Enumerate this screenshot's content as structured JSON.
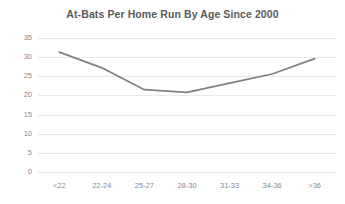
{
  "chart_data": {
    "type": "line",
    "title": "At-Bats Per Home Run By Age Since 2000",
    "xlabel": "",
    "ylabel": "",
    "categories": [
      "<22",
      "22-24",
      "25-27",
      "28-30",
      "31-33",
      "34-36",
      ">36"
    ],
    "values": [
      31.3,
      27.2,
      21.5,
      20.8,
      23.2,
      25.6,
      29.6
    ],
    "series": [
      {
        "name": "At-Bats Per Home Run",
        "values": [
          31.3,
          27.2,
          21.5,
          20.8,
          23.2,
          25.6,
          29.6
        ]
      }
    ],
    "ylim": [
      0,
      35
    ],
    "ytick_values": [
      0,
      5,
      10,
      15,
      20,
      25,
      30,
      35
    ],
    "ytick_labels": [
      "0",
      "5",
      "10",
      "15",
      "20",
      "25",
      "30",
      "35"
    ],
    "xtick_labels": [
      "<22",
      "22-24",
      "25-27",
      "28-30",
      "31-33",
      "34-36",
      ">36"
    ],
    "grid": true,
    "grid_axis": "y",
    "legend": false,
    "legend_position": "none",
    "line_color": "#808080",
    "grid_color": "#e8e8e8",
    "text_color": "#8a8a8a",
    "title_color": "#5a5a5a",
    "background_color": "#ffffff"
  }
}
